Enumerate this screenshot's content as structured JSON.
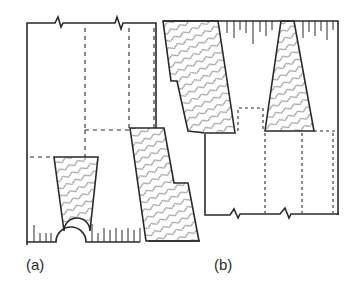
{
  "diagram": {
    "type": "technical drawing",
    "panels": [
      {
        "id": "a",
        "label": "(a)",
        "description": "Wall section with break line at top, tapered hatched insert and stepped hatched block at bottom, semicircular notch at base"
      },
      {
        "id": "b",
        "label": "(b)",
        "description": "Inverted wall section with break line at bottom, stepped hatched block and tapered hatched insert at top"
      }
    ],
    "colors": {
      "line": "#2a2a2a",
      "hatch": "#555555",
      "background": "#ffffff"
    }
  }
}
